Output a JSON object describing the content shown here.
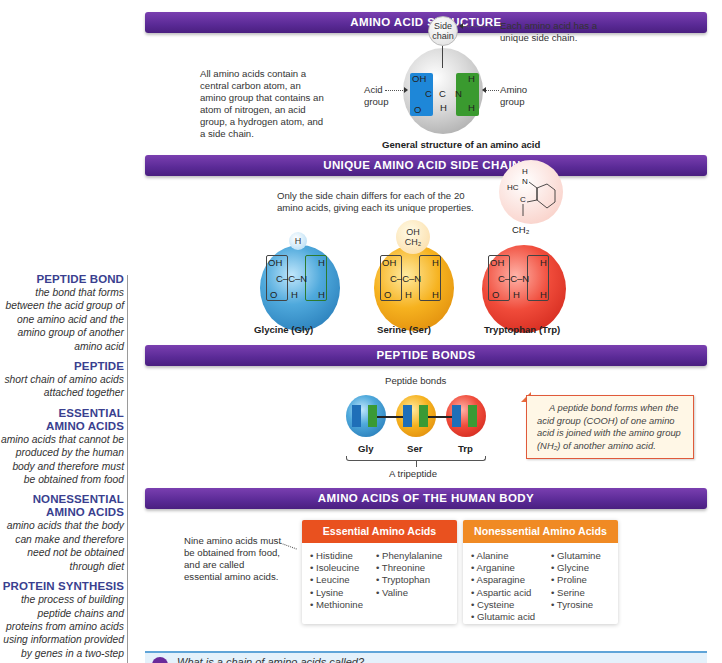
{
  "glossary": [
    {
      "term": "PEPTIDE BOND",
      "definition": "the bond that forms between the acid group of one amino acid and the amino group of another amino acid"
    },
    {
      "term": "PEPTIDE",
      "definition": "short chain of amino acids attached together"
    },
    {
      "term": "ESSENTIAL AMINO ACIDS",
      "definition": "amino acids that cannot be produced by the human body and therefore must be obtained from food"
    },
    {
      "term": "NONESSENTIAL AMINO ACIDS",
      "definition": "amino acids that the body can make and therefore need not be obtained through diet"
    },
    {
      "term": "PROTEIN SYNTHESIS",
      "definition": "the process of building peptide chains and proteins from amino acids using information provided by genes in a two-step"
    }
  ],
  "structure": {
    "title": "AMINO ACID STRUCTURE",
    "intro": "All amino acids contain a central carbon atom, an amino group that contains an atom of nitrogen, an acid group, a hydrogen atom, and a side chain.",
    "side_chain_label": "Side chain",
    "side_chain_note": "Each amino acid has a unique side chain.",
    "acid_label": "Acid group",
    "amino_label": "Amino group",
    "caption": "General structure of an amino acid",
    "atoms": {
      "oh": "OH",
      "c": "C",
      "ch": "C",
      "n": "N",
      "o": "O",
      "h": "H"
    }
  },
  "side_chains": {
    "title": "UNIQUE AMINO ACID SIDE CHAINS",
    "intro": "Only the side chain differs for each of the 20 amino acids, giving each its unique properties.",
    "acids": [
      {
        "name": "Glycine (Gly)",
        "side": "H",
        "color": "#2e86c8"
      },
      {
        "name": "Serine (Ser)",
        "side": "OH / CH2",
        "color": "#f3a81a"
      },
      {
        "name": "Tryptophan (Trp)",
        "side": "indole / CH2",
        "color": "#e8392b"
      }
    ]
  },
  "peptide_bonds": {
    "title": "PEPTIDE BONDS",
    "bonds_label": "Peptide bonds",
    "residues": [
      "Gly",
      "Ser",
      "Trp"
    ],
    "tripeptide_label": "A tripeptide",
    "callout": "A peptide bond forms when the acid group (COOH) of one amino acid is joined with the amino group (NH₂) of another amino acid."
  },
  "human_body": {
    "title": "AMINO ACIDS OF THE HUMAN BODY",
    "note": "Nine amino acids must be obtained from food, and are called essential amino acids.",
    "essential": {
      "header": "Essential Amino Acids",
      "color": "#e9511f",
      "col1": [
        "Histidine",
        "Isoleucine",
        "Leucine",
        "Lysine",
        "Methionine"
      ],
      "col2": [
        "Phenylalanine",
        "Threonine",
        "Tryptophan",
        "Valine"
      ]
    },
    "nonessential": {
      "header": "Nonessential Amino Acids",
      "color": "#f08a24",
      "col1": [
        "Alanine",
        "Arganine",
        "Asparagine",
        "Aspartic acid",
        "Cysteine",
        "Glutamic acid"
      ],
      "col2": [
        "Glutamine",
        "Glycine",
        "Proline",
        "Serine",
        "Tyrosine"
      ]
    }
  },
  "question": {
    "text": "What is a chain of amino acids called?"
  },
  "colors": {
    "banner": "#5a2a96",
    "term": "#3a3f8f"
  }
}
